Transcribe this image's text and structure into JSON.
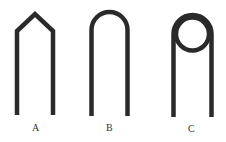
{
  "figure": {
    "stroke_color": "#2a2a2a",
    "background": "#ffffff",
    "shapes": [
      {
        "id": "A",
        "label": "A",
        "description": "pointed (gabled) bend"
      },
      {
        "id": "B",
        "label": "B",
        "description": "round U bend"
      },
      {
        "id": "C",
        "label": "C",
        "description": "loop (circle) bend"
      }
    ]
  }
}
